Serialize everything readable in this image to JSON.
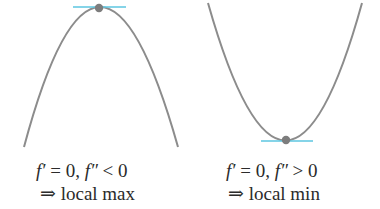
{
  "colors": {
    "curve": "#8c8c8c",
    "point": "#7d7d7d",
    "tangent": "#5cc6e0",
    "text": "#2b2b2b",
    "background": "#ffffff"
  },
  "panels": [
    {
      "id": "local-max",
      "shape": "concave-down parabola",
      "condition_line": "f′ = 0, f″ < 0",
      "conclusion_line": "⇒ local max",
      "condition_parts": {
        "f1": "f′",
        "eq": " = 0, ",
        "f2": "f″",
        "rel": " < 0"
      },
      "implies_symbol": "⇒",
      "conclusion": "local max"
    },
    {
      "id": "local-min",
      "shape": "concave-up parabola",
      "condition_line": "f′ = 0, f″ > 0",
      "conclusion_line": "⇒ local min",
      "condition_parts": {
        "f1": "f′",
        "eq": " = 0, ",
        "f2": "f″",
        "rel": " > 0"
      },
      "implies_symbol": "⇒",
      "conclusion": "local min"
    }
  ]
}
